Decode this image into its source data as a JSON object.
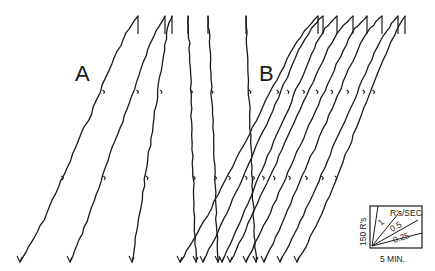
{
  "chart_data": {
    "type": "line",
    "title": "",
    "panels": [
      {
        "label": "A",
        "series": [
          {
            "name": "A-1",
            "points": [
              [
                0,
                0
              ],
              [
                1,
                0.08
              ],
              [
                2,
                0.17
              ],
              [
                3,
                0.28
              ],
              [
                4,
                0.38
              ],
              [
                5,
                0.5
              ],
              [
                6,
                0.6
              ],
              [
                7,
                0.72
              ],
              [
                8,
                0.83
              ],
              [
                9,
                0.93
              ],
              [
                10,
                1.0
              ]
            ]
          },
          {
            "name": "A-2",
            "points": [
              [
                0,
                0
              ],
              [
                1,
                0.09
              ],
              [
                2,
                0.19
              ],
              [
                3,
                0.3
              ],
              [
                4,
                0.41
              ],
              [
                5,
                0.52
              ],
              [
                6,
                0.62
              ],
              [
                7,
                0.73
              ],
              [
                8,
                0.84
              ],
              [
                9,
                0.94
              ],
              [
                10,
                1.0
              ]
            ]
          },
          {
            "name": "A-3",
            "points": [
              [
                0,
                0
              ],
              [
                1,
                0.1
              ],
              [
                2,
                0.2
              ],
              [
                3,
                0.31
              ],
              [
                4,
                0.42
              ],
              [
                5,
                0.53
              ],
              [
                6,
                0.64
              ],
              [
                7,
                0.75
              ],
              [
                8,
                0.86
              ],
              [
                9,
                0.95
              ],
              [
                10,
                1.0
              ]
            ]
          },
          {
            "name": "A-4",
            "points": [
              [
                0,
                0
              ],
              [
                1,
                0.1
              ],
              [
                2,
                0.21
              ],
              [
                3,
                0.32
              ],
              [
                4,
                0.43
              ],
              [
                5,
                0.54
              ],
              [
                6,
                0.65
              ],
              [
                7,
                0.76
              ],
              [
                8,
                0.87
              ],
              [
                9,
                0.95
              ],
              [
                10,
                1.0
              ]
            ]
          },
          {
            "name": "A-5",
            "points": [
              [
                0,
                0
              ],
              [
                1,
                0.1
              ],
              [
                2,
                0.2
              ],
              [
                3,
                0.31
              ],
              [
                4,
                0.42
              ],
              [
                5,
                0.52
              ],
              [
                6,
                0.63
              ],
              [
                7,
                0.74
              ],
              [
                8,
                0.85
              ],
              [
                9,
                0.94
              ],
              [
                10,
                1.0
              ]
            ]
          },
          {
            "name": "A-6",
            "points": [
              [
                0,
                0
              ],
              [
                1,
                0.08
              ],
              [
                2,
                0.17
              ],
              [
                3,
                0.26
              ],
              [
                4,
                0.36
              ],
              [
                5,
                0.46
              ],
              [
                6,
                0.57
              ],
              [
                7,
                0.68
              ],
              [
                8,
                0.8
              ],
              [
                9,
                0.91
              ],
              [
                10,
                1.0
              ]
            ]
          }
        ]
      },
      {
        "label": "B",
        "series": [
          {
            "name": "B-1",
            "points": [
              [
                0,
                0
              ],
              [
                1,
                0.09
              ],
              [
                2,
                0.19
              ],
              [
                3,
                0.3
              ],
              [
                4,
                0.41
              ],
              [
                5,
                0.52
              ],
              [
                6,
                0.63
              ],
              [
                7,
                0.74
              ],
              [
                8,
                0.85
              ],
              [
                9,
                0.94
              ],
              [
                10,
                1.0
              ]
            ]
          },
          {
            "name": "B-2",
            "points": [
              [
                0,
                0
              ],
              [
                1,
                0.1
              ],
              [
                2,
                0.2
              ],
              [
                3,
                0.31
              ],
              [
                4,
                0.42
              ],
              [
                5,
                0.53
              ],
              [
                6,
                0.64
              ],
              [
                7,
                0.75
              ],
              [
                8,
                0.86
              ],
              [
                9,
                0.95
              ],
              [
                10,
                1.0
              ]
            ]
          },
          {
            "name": "B-3",
            "points": [
              [
                0,
                0
              ],
              [
                1,
                0.1
              ],
              [
                2,
                0.21
              ],
              [
                3,
                0.32
              ],
              [
                4,
                0.43
              ],
              [
                5,
                0.54
              ],
              [
                6,
                0.65
              ],
              [
                7,
                0.76
              ],
              [
                8,
                0.87
              ],
              [
                9,
                0.95
              ],
              [
                10,
                1.0
              ]
            ]
          },
          {
            "name": "B-4",
            "points": [
              [
                0,
                0
              ],
              [
                1,
                0.1
              ],
              [
                2,
                0.21
              ],
              [
                3,
                0.32
              ],
              [
                4,
                0.43
              ],
              [
                5,
                0.54
              ],
              [
                6,
                0.65
              ],
              [
                7,
                0.76
              ],
              [
                8,
                0.87
              ],
              [
                9,
                0.95
              ],
              [
                10,
                1.0
              ]
            ]
          },
          {
            "name": "B-5",
            "points": [
              [
                0,
                0
              ],
              [
                1,
                0.1
              ],
              [
                2,
                0.2
              ],
              [
                3,
                0.31
              ],
              [
                4,
                0.42
              ],
              [
                5,
                0.53
              ],
              [
                6,
                0.64
              ],
              [
                7,
                0.75
              ],
              [
                8,
                0.86
              ],
              [
                9,
                0.95
              ],
              [
                10,
                1.0
              ]
            ]
          },
          {
            "name": "B-6",
            "points": [
              [
                0,
                0
              ],
              [
                1,
                0.1
              ],
              [
                2,
                0.21
              ],
              [
                3,
                0.32
              ],
              [
                4,
                0.43
              ],
              [
                5,
                0.54
              ],
              [
                6,
                0.65
              ],
              [
                7,
                0.76
              ],
              [
                8,
                0.87
              ],
              [
                9,
                0.95
              ],
              [
                10,
                1.0
              ]
            ]
          },
          {
            "name": "B-7",
            "points": [
              [
                0,
                0
              ],
              [
                1,
                0.09
              ],
              [
                2,
                0.19
              ],
              [
                3,
                0.3
              ],
              [
                4,
                0.41
              ],
              [
                5,
                0.52
              ],
              [
                6,
                0.63
              ],
              [
                7,
                0.74
              ],
              [
                8,
                0.85
              ],
              [
                9,
                0.94
              ],
              [
                10,
                1.0
              ]
            ]
          },
          {
            "name": "B-8",
            "points": [
              [
                0,
                0
              ],
              [
                1,
                0.08
              ],
              [
                2,
                0.17
              ],
              [
                3,
                0.27
              ],
              [
                4,
                0.38
              ],
              [
                5,
                0.49
              ],
              [
                6,
                0.6
              ],
              [
                7,
                0.71
              ],
              [
                8,
                0.82
              ],
              [
                9,
                0.92
              ],
              [
                10,
                1.0
              ]
            ]
          }
        ]
      }
    ],
    "legend": {
      "placement": "bottom-right",
      "y_scale_label": "150 R's",
      "x_scale_label": "5 MIN.",
      "rate_units": "R's/SEC",
      "rate_labels": [
        "1",
        "0.5",
        "0.25"
      ]
    }
  }
}
